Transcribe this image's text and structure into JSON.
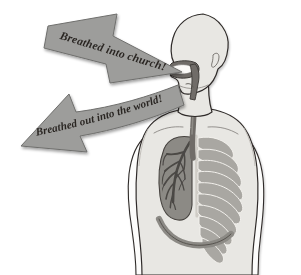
{
  "illustration": {
    "title": "Breathing into church and out into the world",
    "background_color": "#ffffff"
  },
  "arrows": [
    {
      "id": "arrow-inhale",
      "label": "Breathed into church!",
      "direction": "down-right",
      "points_to": "mouth",
      "fill_color": "#9d9d9b",
      "stroke_color": "#6f6f6d",
      "text_color": "#2b2724"
    },
    {
      "id": "arrow-exhale",
      "label": "Breathed out into the world!",
      "direction": "down-left",
      "points_away_from": "mouth",
      "fill_color": "#9d9d9b",
      "stroke_color": "#6f6f6d",
      "text_color": "#2b2724"
    }
  ],
  "figure": {
    "name": "human-torso-respiratory-system",
    "view": "head-in-profile-facing-left-torso-frontal",
    "skin_fill": "#e8e7e3",
    "outline_color": "#2f2b29",
    "parts": [
      {
        "name": "head",
        "label": "Head",
        "fill": "#e8e7e3"
      },
      {
        "name": "ear",
        "label": "Ear",
        "fill": "#e8e7e3"
      },
      {
        "name": "neck",
        "label": "Neck",
        "fill": "#e8e7e3"
      },
      {
        "name": "shoulders",
        "label": "Shoulders",
        "fill": "#e8e7e3"
      },
      {
        "name": "arms",
        "label": "Arms",
        "fill": "#ffffff"
      },
      {
        "name": "torso",
        "label": "Torso",
        "fill": "#e8e7e3"
      },
      {
        "name": "nasal-oral-cavity",
        "label": "Nasal and oral cavity",
        "fill": "#6f6c68"
      },
      {
        "name": "pharynx",
        "label": "Pharynx",
        "fill": "#6f6c68"
      },
      {
        "name": "trachea",
        "label": "Trachea",
        "fill": "#6f6c68"
      },
      {
        "name": "lung",
        "label": "Lung",
        "fill": "#8c8a85"
      },
      {
        "name": "bronchial-tree",
        "label": "Bronchial tree",
        "fill": "#5e5b57"
      },
      {
        "name": "ribcage",
        "label": "Rib cage",
        "fill": "#a9a7a2"
      },
      {
        "name": "diaphragm",
        "label": "Diaphragm",
        "fill": "#8c8a85"
      }
    ]
  },
  "colors": {
    "arrow_fill": "#9d9d9b",
    "arrow_stroke": "#6f6f6d",
    "text": "#2b2724",
    "skin": "#e8e7e3",
    "organ_dark": "#6f6c68",
    "organ_mid": "#8c8a85",
    "organ_light": "#a9a7a2",
    "outline": "#2f2b29",
    "background": "#ffffff"
  }
}
